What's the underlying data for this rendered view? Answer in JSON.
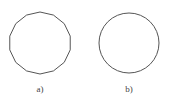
{
  "figure": {
    "panels": [
      {
        "id": "a",
        "label": "a)",
        "shape": "regular-polygon",
        "sides": 14,
        "center": [
          40,
          43
        ],
        "radius": 31
      },
      {
        "id": "b",
        "label": "b)",
        "shape": "circle",
        "center": [
          129,
          43
        ],
        "radius": 30
      }
    ],
    "stroke_color": "#555555",
    "stroke_width": 1
  }
}
